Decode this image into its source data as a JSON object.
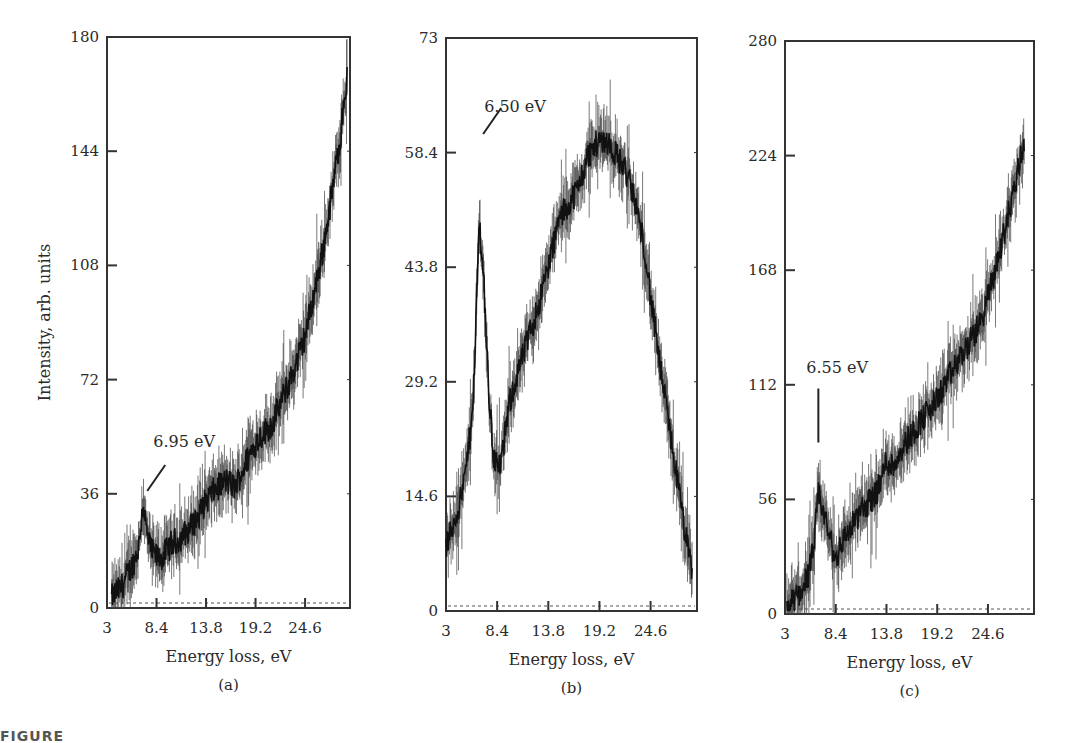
{
  "figure": {
    "caption_fragment": "FIGURE"
  },
  "chart_data": [
    {
      "type": "line",
      "panel_label": "(a)",
      "title": "",
      "xlabel": "Energy loss, eV",
      "ylabel": "Intensity, arb. units",
      "x_ticks": [
        "3",
        "8.4",
        "13.8",
        "19.2",
        "24.6"
      ],
      "y_ticks": [
        "0",
        "36",
        "72",
        "108",
        "144",
        "180"
      ],
      "xlim": [
        3,
        29.5
      ],
      "ylim": [
        0,
        180
      ],
      "grid": false,
      "baseline": "dotted line at y=0",
      "annotation": {
        "text": "6.95 eV",
        "x": 6.95,
        "y": 35
      },
      "x": [
        3.5,
        4,
        4.5,
        5,
        5.5,
        6,
        6.5,
        6.95,
        7.3,
        7.8,
        8.4,
        9,
        10,
        11,
        12,
        13,
        13.8,
        15,
        16,
        17,
        18,
        19.2,
        20,
        21,
        22,
        23,
        24,
        24.6,
        25.5,
        26.5,
        27.5,
        28.5,
        29.2
      ],
      "values": [
        3,
        5,
        6,
        9,
        12,
        15,
        20,
        34,
        24,
        18,
        16,
        16,
        20,
        22,
        25,
        29,
        34,
        38,
        40,
        38,
        45,
        52,
        55,
        58,
        65,
        72,
        80,
        86,
        98,
        112,
        130,
        150,
        168
      ]
    },
    {
      "type": "line",
      "panel_label": "(b)",
      "title": "",
      "xlabel": "Energy loss, eV",
      "ylabel": "",
      "x_ticks": [
        "3",
        "8.4",
        "13.8",
        "19.2",
        "24.6"
      ],
      "y_ticks": [
        "0",
        "14.6",
        "29.2",
        "43.8",
        "58.4",
        "73"
      ],
      "xlim": [
        3,
        29.5
      ],
      "ylim": [
        0,
        73
      ],
      "grid": false,
      "baseline": "dotted line at y=0",
      "annotation": {
        "text": "6.50 eV",
        "x": 6.5,
        "y": 60
      },
      "x": [
        3,
        3.5,
        4,
        4.5,
        5,
        5.5,
        6,
        6.5,
        7,
        7.5,
        8,
        8.5,
        9,
        9.5,
        10,
        10.5,
        11,
        12,
        13,
        13.8,
        15,
        16,
        17,
        18,
        19.2,
        20,
        21,
        22,
        23,
        24,
        24.6,
        25.5,
        26.5,
        27.5,
        28.5,
        29
      ],
      "values": [
        8,
        10,
        12,
        14,
        17,
        22,
        30,
        50,
        42,
        28,
        20,
        18,
        20,
        25,
        28,
        30,
        32,
        36,
        40,
        44,
        50,
        52,
        54,
        58,
        60,
        60,
        58,
        56,
        52,
        46,
        40,
        32,
        24,
        16,
        8,
        5
      ]
    },
    {
      "type": "line",
      "panel_label": "(c)",
      "title": "",
      "xlabel": "Energy loss, eV",
      "ylabel": "",
      "x_ticks": [
        "3",
        "8.4",
        "13.8",
        "19.2",
        "24.6"
      ],
      "y_ticks": [
        "0",
        "56",
        "112",
        "168",
        "224",
        "280"
      ],
      "xlim": [
        3,
        29.5
      ],
      "ylim": [
        0,
        280
      ],
      "grid": false,
      "baseline": "dotted line at y=0",
      "annotation": {
        "text": "6.55 eV",
        "x": 6.55,
        "y": 75
      },
      "x": [
        3.2,
        4,
        4.8,
        5.5,
        6,
        6.55,
        7,
        7.6,
        8.4,
        9,
        10,
        11,
        12,
        13,
        13.8,
        14.5,
        15.5,
        16.5,
        17.5,
        18.5,
        19.2,
        20,
        21,
        22,
        23,
        24,
        24.6,
        25.5,
        26.5,
        27.5,
        28.5
      ],
      "values": [
        3,
        7,
        12,
        20,
        30,
        58,
        52,
        40,
        26,
        35,
        42,
        50,
        55,
        62,
        75,
        72,
        82,
        88,
        95,
        100,
        105,
        112,
        120,
        128,
        135,
        145,
        155,
        170,
        190,
        210,
        232
      ]
    }
  ]
}
